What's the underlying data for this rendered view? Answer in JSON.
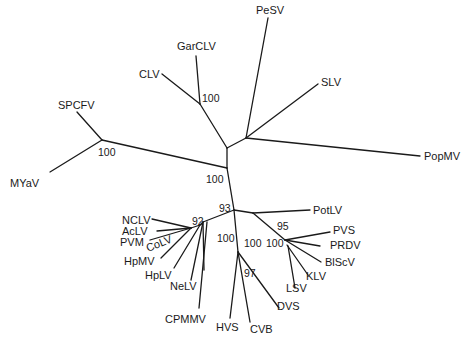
{
  "diagram": {
    "type": "unrooted phylogenetic tree",
    "taxa": [
      "PeSV",
      "GarCLV",
      "CLV",
      "SLV",
      "SPCFV",
      "PopMV",
      "MYaV",
      "NCLV",
      "AcLV",
      "PVM",
      "CoLV",
      "HpMV",
      "HpLV",
      "NeLV",
      "CPMMV",
      "HVS",
      "CVB",
      "DVS",
      "LSV",
      "KLV",
      "BlScV",
      "PRDV",
      "PVS",
      "PotLV"
    ],
    "bootstrap": {
      "garclv_clv": "100",
      "spcfv_myav": "100",
      "central": "100",
      "node_93": "93",
      "node_92": "92",
      "node_95": "95",
      "carla_100a": "100",
      "carla_100b": "100",
      "carla_100c": "100",
      "node_97": "97"
    }
  }
}
